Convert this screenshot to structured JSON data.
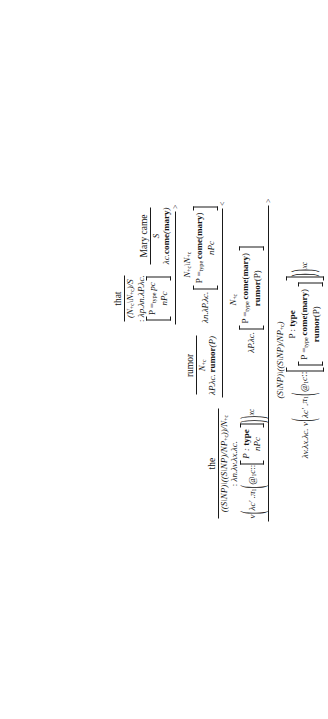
{
  "figure": {
    "kind": "ccg-type-theoretic-derivation",
    "orientation": "rotated-90-ccw",
    "sentence": "the rumor that Mary came"
  },
  "rule_labels": {
    "forward": ">",
    "backward": "<"
  },
  "symbols": {
    "lambda": "λ",
    "pi": "π",
    "nu": "ν",
    "at": "@",
    "dcolon": "::",
    "eq": "=",
    "backslash": "\\",
    "slash": "/"
  },
  "leaves": [
    {
      "id": "leaf-the",
      "word": "the",
      "category": "((S\\NP)\\((S\\NP)/NP+c))/N+c",
      "cat_parts": [
        "((S\\NP)\\((S\\NP)/NP",
        "+c",
        "))/N",
        "+c"
      ],
      "term_prefix": ": λn.λv.λx.λc.",
      "term_body": "ν ( λc′ . π1 ( @1c :: [ P : type ; nPc ] ) ) xc",
      "binder": "λn.λv.λx.λc.",
      "box_lines": [
        "P : type",
        "nPc"
      ]
    },
    {
      "id": "leaf-rumor",
      "word": "rumor",
      "category": "N+c",
      "term": "λP.λc. rumor(P)"
    },
    {
      "id": "leaf-that",
      "word": "that",
      "category": "(N+c\\N+c)/S",
      "term_prefix": ": λp.λn.λP.λc.",
      "binder": "λp.λn.λP.λc.",
      "box_lines": [
        "P =type pc",
        "nPc"
      ]
    },
    {
      "id": "leaf-mary-came",
      "word": "Mary came",
      "category": "S",
      "term": "λc.come(mary)"
    }
  ],
  "nodes": [
    {
      "id": "node-that-mary-came",
      "rule": ">",
      "category": "N+c\\N+c",
      "binder": "λn.λP.λc.",
      "box_lines": [
        "P =type come(mary)",
        "nPc"
      ]
    },
    {
      "id": "node-rumor-that-mary-came",
      "rule": "<",
      "category": "N+c",
      "binder": "λP.λc.",
      "box_lines": [
        "P =type come(mary)",
        "rumor(P)"
      ]
    },
    {
      "id": "node-the-rumor-that-mary-came",
      "rule": ">",
      "category": "(S\\NP)\\((S\\NP)/NP+c)",
      "binder": "λv.λx.λc.",
      "term_head": "ν ( λc′ . π1 ( @1c ::",
      "outer_box_line": "P : type",
      "inner_box_lines": [
        "P =type come(mary)",
        "rumor(P)"
      ],
      "term_tail": ") ) xc"
    }
  ],
  "text": {
    "word_the": "the",
    "word_rumor": "rumor",
    "word_that": "that",
    "word_mary_came": "Mary came",
    "cat_S": "S",
    "term_mary_came": "λc.come(mary)",
    "term_rumor": "λP.λc. rumor(P)",
    "binder_that": "λp.λn.λP.λc.",
    "binder_that_mc": "λn.λP.λc.",
    "binder_rumor_that": "λP.λc.",
    "binder_the": "λn.λv.λx.λc.",
    "binder_final": "λv.λx.λc.",
    "nu": "ν",
    "lam_cprime": "λc′ .",
    "pi1": "π1",
    "at1c": "@1c",
    "dcolon": "::",
    "xc": "xc",
    "nPc": "nPc",
    "P_type": "P : type",
    "P_eq_pc": "P =type pc",
    "P_eq_come": "P =type come(mary)",
    "rumorP": "rumor(P)",
    "rule_fwd": ">",
    "rule_bwd": "<",
    "colon": ":"
  }
}
